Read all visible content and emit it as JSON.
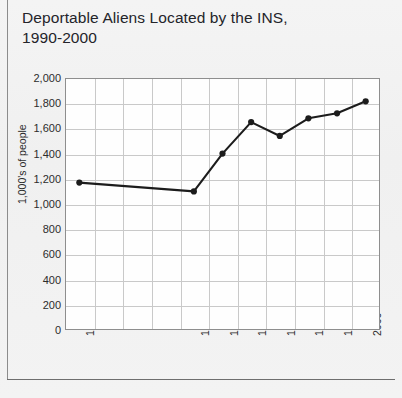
{
  "title": {
    "line1": "Deportable Aliens Located by the INS,",
    "line2": "1990-2000"
  },
  "chart_data": {
    "type": "line",
    "title": "Deportable Aliens Located by the INS, 1990-2000",
    "xlabel": "",
    "ylabel": "1,000's of people",
    "ylim": [
      0,
      2000
    ],
    "ytick_step": 200,
    "ytick_labels": [
      "2,000",
      "1,800",
      "1,600",
      "1,400",
      "1,200",
      "1,000",
      "800",
      "600",
      "400",
      "200",
      "0"
    ],
    "ytick_values": [
      2000,
      1800,
      1600,
      1400,
      1200,
      1000,
      800,
      600,
      400,
      200,
      0
    ],
    "categories": [
      "1990",
      "1991",
      "1992",
      "1993",
      "1994",
      "1995",
      "1996",
      "1997",
      "1998",
      "1999",
      "2000"
    ],
    "xtick_labels": [
      "1990",
      "",
      "",
      "",
      "1994",
      "1995",
      "1996",
      "1997",
      "1998",
      "1999",
      "2000"
    ],
    "xtick_labels_rotated": true,
    "values": [
      1170,
      null,
      null,
      null,
      1100,
      1400,
      1650,
      1540,
      1680,
      1720,
      1815
    ],
    "marker_points": [
      {
        "x": "1990",
        "y": 1170
      },
      {
        "x": "1994",
        "y": 1100
      },
      {
        "x": "1995",
        "y": 1400
      },
      {
        "x": "1996",
        "y": 1650
      },
      {
        "x": "1997",
        "y": 1540
      },
      {
        "x": "1998",
        "y": 1680
      },
      {
        "x": "1999",
        "y": 1720
      },
      {
        "x": "2000",
        "y": 1815
      }
    ],
    "grid": true,
    "legend": "none",
    "series_color": "#1c1c1c",
    "grid_color": "#c9c9c9",
    "plot_bg": "#fefefe"
  }
}
